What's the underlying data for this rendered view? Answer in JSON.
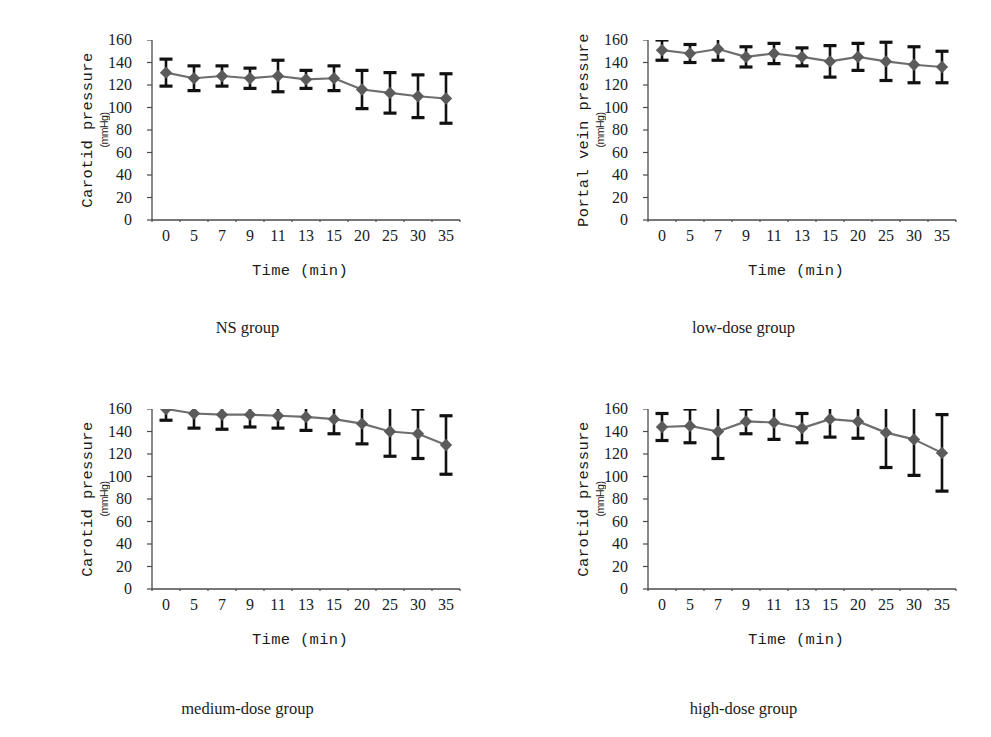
{
  "figure": {
    "background": "#ffffff",
    "marker_color": "#5b5b5b",
    "line_color": "#6e6e6e",
    "errorbar_color": "#111111",
    "axis_color": "#4a4a4a"
  },
  "panels": [
    {
      "id": "ns-group",
      "position": "top-left",
      "caption": "NS group",
      "ytitle_main": "Carotid pressure",
      "ytitle_unit": "(mmHg)",
      "xtitle": "Time (min)",
      "chart_data": {
        "type": "line",
        "title": "NS group",
        "xlabel": "Time (min)",
        "ylabel": "Carotid pressure (mmHg)",
        "ylim": [
          0,
          160
        ],
        "yticks": [
          0,
          20,
          40,
          60,
          80,
          100,
          120,
          140,
          160
        ],
        "grid": false,
        "legend": "none",
        "categories": [
          "0",
          "5",
          "7",
          "9",
          "11",
          "13",
          "15",
          "20",
          "25",
          "30",
          "35"
        ],
        "values": [
          131,
          126,
          128,
          126,
          128,
          125,
          126,
          116,
          113,
          110,
          108
        ],
        "errors": [
          12,
          11,
          9,
          9,
          14,
          8,
          11,
          17,
          18,
          19,
          22
        ]
      }
    },
    {
      "id": "low-dose-group",
      "position": "top-right",
      "caption": "low-dose group",
      "ytitle_main": "Portal vein pressure",
      "ytitle_unit": "(mmHg)",
      "xtitle": "Time (min)",
      "chart_data": {
        "type": "line",
        "title": "low-dose group",
        "xlabel": "Time (min)",
        "ylabel": "Portal vein pressure (mmHg)",
        "ylim": [
          0,
          160
        ],
        "yticks": [
          0,
          20,
          40,
          60,
          80,
          100,
          120,
          140,
          160
        ],
        "grid": false,
        "legend": "none",
        "categories": [
          "0",
          "5",
          "7",
          "9",
          "11",
          "13",
          "15",
          "20",
          "25",
          "30",
          "35"
        ],
        "values": [
          151,
          148,
          152,
          145,
          148,
          145,
          141,
          145,
          141,
          138,
          136
        ],
        "errors": [
          9,
          8,
          10,
          9,
          9,
          8,
          14,
          12,
          17,
          16,
          14
        ]
      }
    },
    {
      "id": "medium-dose-group",
      "position": "bottom-left",
      "caption": "medium-dose group",
      "ytitle_main": "Carotid pressure",
      "ytitle_unit": "(mmHg)",
      "xtitle": "Time (min)",
      "chart_data": {
        "type": "line",
        "title": "medium-dose group",
        "xlabel": "Time (min)",
        "ylabel": "Carotid pressure (mmHg)",
        "ylim": [
          0,
          160
        ],
        "yticks": [
          0,
          20,
          40,
          60,
          80,
          100,
          120,
          140,
          160
        ],
        "grid": false,
        "legend": "none",
        "categories": [
          "0",
          "5",
          "7",
          "9",
          "11",
          "13",
          "15",
          "20",
          "25",
          "30",
          "35"
        ],
        "values": [
          160,
          156,
          155,
          155,
          154,
          153,
          151,
          147,
          140,
          138,
          128
        ],
        "errors": [
          10,
          13,
          13,
          11,
          11,
          12,
          13,
          18,
          22,
          22,
          26
        ]
      }
    },
    {
      "id": "high-dose-group",
      "position": "bottom-right",
      "caption": "high-dose group",
      "ytitle_main": "Carotid pressure",
      "ytitle_unit": "(mmHg)",
      "xtitle": "Time (min)",
      "chart_data": {
        "type": "line",
        "title": "high-dose group",
        "xlabel": "Time (min)",
        "ylabel": "Carotid pressure (mmHg)",
        "ylim": [
          0,
          160
        ],
        "yticks": [
          0,
          20,
          40,
          60,
          80,
          100,
          120,
          140,
          160
        ],
        "grid": false,
        "legend": "none",
        "categories": [
          "0",
          "5",
          "7",
          "9",
          "11",
          "13",
          "15",
          "20",
          "25",
          "30",
          "35"
        ],
        "values": [
          144,
          145,
          140,
          149,
          148,
          143,
          151,
          149,
          139,
          133,
          121
        ],
        "errors": [
          12,
          15,
          24,
          11,
          15,
          13,
          16,
          15,
          31,
          32,
          34
        ]
      }
    }
  ]
}
